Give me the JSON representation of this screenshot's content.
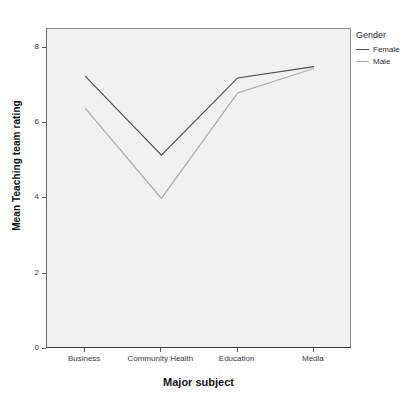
{
  "chart_data": {
    "type": "line",
    "title": "",
    "xlabel": "Major subject",
    "ylabel": "Mean Teaching team rating",
    "categories": [
      "Business",
      "Community Health",
      "Education",
      "Media"
    ],
    "ylim": [
      0,
      8.5
    ],
    "yticks": [
      0,
      2,
      4,
      6,
      8
    ],
    "ytick_labels": [
      "0",
      "2",
      "4",
      "6",
      "8"
    ],
    "grid": false,
    "legend": {
      "title": "Gender",
      "position": "right",
      "entries": [
        {
          "label": "Female",
          "color": "#4d4d4d"
        },
        {
          "label": "Male",
          "color": "#aaaaaa"
        }
      ]
    },
    "series": [
      {
        "name": "Female",
        "color": "#4d4d4d",
        "values": [
          7.25,
          5.15,
          7.2,
          7.5
        ]
      },
      {
        "name": "Male",
        "color": "#aaaaaa",
        "values": [
          6.4,
          4.0,
          6.8,
          7.45
        ]
      }
    ]
  },
  "colors": {
    "plot_background": "#f1f1f1",
    "axis": "#3a3a3a",
    "text": "#2c2c2c"
  }
}
